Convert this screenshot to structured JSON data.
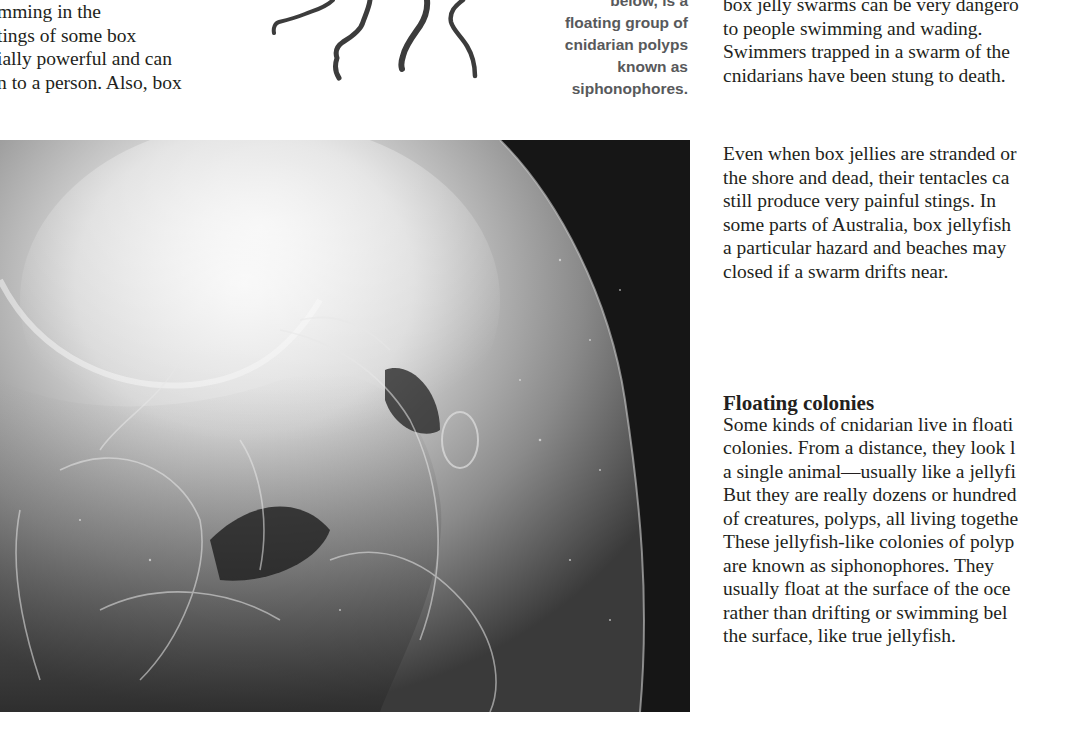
{
  "page": {
    "left_column": {
      "lines": [
        "mming in the",
        "tings of some box",
        "ially powerful and can",
        "n to a person. Also, box"
      ]
    },
    "illustration": {
      "name": "siphonophore-tentacles",
      "description": "ink drawing of trailing tentacles"
    },
    "caption": {
      "lines": [
        "below, is a",
        "floating group of",
        "cnidarian polyps",
        "known as",
        "siphonophores."
      ]
    },
    "right_column": {
      "top_lines": [
        "box jelly swarms can be very dangero",
        "to people swimming and wading.",
        "Swimmers trapped in a swarm of the",
        "cnidarians have been stung to death."
      ],
      "paragraph2_lines": [
        "Even when box jellies are stranded or",
        "the shore and dead, their tentacles ca",
        "still produce very painful stings. In",
        "some parts of Australia, box jellyfish",
        "a particular hazard and beaches may",
        "closed if a swarm drifts near."
      ],
      "section": {
        "heading": "Floating colonies",
        "lines": [
          "Some kinds of cnidarian live in floati",
          "colonies. From a distance, they look l",
          "a single animal—usually like a jellyfi",
          "But they are really dozens or hundred",
          "of creatures, polyps, all living togethe",
          "These jellyfish-like colonies of polyp",
          "are known as siphonophores. They",
          "usually float at the surface of the oce",
          "rather than drifting or swimming bel",
          "the surface, like true jellyfish."
        ]
      }
    },
    "photo": {
      "name": "box-jellyfish-photo",
      "description": "black-and-white close-up photograph of a translucent box jellyfish bell"
    }
  }
}
